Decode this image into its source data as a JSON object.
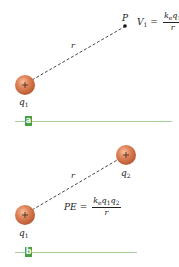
{
  "panels": [
    {
      "id": "a",
      "badge": "a",
      "charges": [
        {
          "symbol": "+",
          "label_base": "q",
          "label_sub": "1",
          "cx": 25,
          "cy": 85
        }
      ],
      "point": {
        "label": "P",
        "x": 125,
        "y": 26
      },
      "distance_label": "r",
      "equation": {
        "lhs_base": "V",
        "lhs_sub": "1",
        "op": "=",
        "numerator": "k",
        "numerator_sub_e": "e",
        "numerator_q": "q",
        "numerator_q_sub": "1",
        "denominator": "r"
      }
    },
    {
      "id": "b",
      "badge": "b",
      "charges": [
        {
          "symbol": "+",
          "label_base": "q",
          "label_sub": "1",
          "cx": 25,
          "cy": 215
        },
        {
          "symbol": "+",
          "label_base": "q",
          "label_sub": "2",
          "cx": 126,
          "cy": 155
        }
      ],
      "distance_label": "r",
      "equation": {
        "lhs": "PE",
        "op": "=",
        "numerator": "k",
        "numerator_sub_e": "e",
        "numerator_q1": "q",
        "numerator_q1_sub": "1",
        "numerator_q2": "q",
        "numerator_q2_sub": "2",
        "denominator": "r"
      }
    }
  ],
  "colors": {
    "charge_fill": "#d9784a",
    "charge_highlight": "#f4b48c",
    "badge": "#4a9e45",
    "baseline": "#a8d29a",
    "dash": "#333333"
  }
}
